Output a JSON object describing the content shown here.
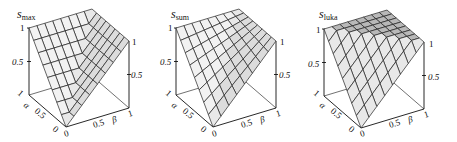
{
  "chart_data": [
    {
      "type": "surface3d",
      "title": "s_max",
      "title_main": "s",
      "title_sub": "max",
      "function": "max(alpha, beta)",
      "xlabel": "α",
      "ylabel": "β",
      "zlabel": "",
      "xlim": [
        0,
        1
      ],
      "ylim": [
        0,
        1
      ],
      "zlim": [
        0,
        1
      ],
      "x_ticks": [
        "0",
        "0.5",
        "1"
      ],
      "y_ticks": [
        "0",
        "0.5",
        "1"
      ],
      "z_ticks": [
        "0.5",
        "1"
      ],
      "grid_n": 8,
      "corners": {
        "a0_b0": 0,
        "a1_b0": 1,
        "a0_b1": 1,
        "a1_b1": 1
      }
    },
    {
      "type": "surface3d",
      "title": "s_sum",
      "title_main": "s",
      "title_sub": "sum",
      "function": "alpha + beta - alpha*beta",
      "xlabel": "α",
      "ylabel": "β",
      "zlabel": "",
      "xlim": [
        0,
        1
      ],
      "ylim": [
        0,
        1
      ],
      "zlim": [
        0,
        1
      ],
      "x_ticks": [
        "0",
        "0.5",
        "1"
      ],
      "y_ticks": [
        "0",
        "0.5",
        "1"
      ],
      "z_ticks": [
        "0.5",
        "1"
      ],
      "grid_n": 8,
      "corners": {
        "a0_b0": 0,
        "a1_b0": 1,
        "a0_b1": 1,
        "a1_b1": 1
      }
    },
    {
      "type": "surface3d",
      "title": "s_luka",
      "title_main": "s",
      "title_sub": "luka",
      "function": "min(1, alpha + beta)",
      "xlabel": "α",
      "ylabel": "β",
      "zlabel": "",
      "xlim": [
        0,
        1
      ],
      "ylim": [
        0,
        1
      ],
      "zlim": [
        0,
        1
      ],
      "x_ticks": [
        "0",
        "0.5",
        "1"
      ],
      "y_ticks": [
        "0",
        "0.5",
        "1"
      ],
      "z_ticks": [
        "0.5",
        "1"
      ],
      "grid_n": 8,
      "corners": {
        "a0_b0": 0,
        "a1_b0": 1,
        "a0_b1": 1,
        "a1_b1": 1
      }
    }
  ],
  "plots": [
    {
      "title_main": "s",
      "title_sub": "max",
      "alpha_label": "α",
      "beta_label": "β",
      "z_tick_1": "1",
      "z_tick_half": "0.5",
      "right_tick_1": "1",
      "right_tick_half": "0.5",
      "a_tick_1": "1",
      "a_tick_half": "0.5",
      "a_tick_0": "0",
      "b_tick_0": "0",
      "b_tick_half": "0.5",
      "b_tick_1": "1"
    },
    {
      "title_main": "s",
      "title_sub": "sum",
      "alpha_label": "α",
      "beta_label": "β",
      "z_tick_1": "1",
      "z_tick_half": "0.5",
      "right_tick_1": "1",
      "right_tick_half": "0.5",
      "a_tick_1": "1",
      "a_tick_half": "0.5",
      "a_tick_0": "0",
      "b_tick_0": "0",
      "b_tick_half": "0.5",
      "b_tick_1": "1"
    },
    {
      "title_main": "s",
      "title_sub": "luka",
      "alpha_label": "α",
      "beta_label": "β",
      "z_tick_1": "1",
      "z_tick_half": "0.5",
      "right_tick_1": "1",
      "right_tick_half": "0.5",
      "a_tick_1": "1",
      "a_tick_half": "0.5",
      "a_tick_0": "0",
      "b_tick_0": "0",
      "b_tick_half": "0.5",
      "b_tick_1": "1"
    }
  ],
  "colors": {
    "surface_light": "#f2f2f2",
    "surface_mid": "#dcdcdc",
    "surface_dark": "#b8b8b8",
    "grid_line": "#222222",
    "axis_line": "#111111"
  }
}
